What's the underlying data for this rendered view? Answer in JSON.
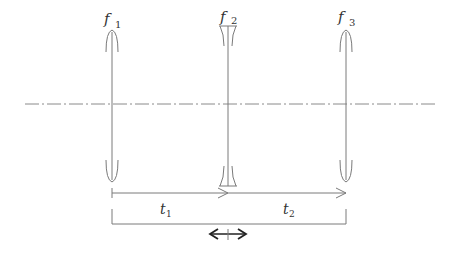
{
  "diagram": {
    "title": "",
    "stroke_color": "#7a7a7a",
    "text_color": "#333333",
    "optical_axis": {
      "style": "dash-dot",
      "y": 104,
      "x_start": 25,
      "x_end": 437
    },
    "lenses": [
      {
        "id": "f1",
        "symbol": "f",
        "subscript": "1",
        "type": "converging",
        "x": 112
      },
      {
        "id": "f2",
        "symbol": "f",
        "subscript": "2",
        "type": "diverging",
        "x": 228
      },
      {
        "id": "f3",
        "symbol": "f",
        "subscript": "3",
        "type": "converging",
        "x": 346
      }
    ],
    "distances": [
      {
        "id": "t1",
        "symbol": "t",
        "subscript": "1",
        "from": "f1",
        "to": "f2"
      },
      {
        "id": "t2",
        "symbol": "t",
        "subscript": "2",
        "from": "f2",
        "to": "f3"
      }
    ],
    "movement_indicator": {
      "type": "double-arrow",
      "applies_to": "f2"
    }
  }
}
